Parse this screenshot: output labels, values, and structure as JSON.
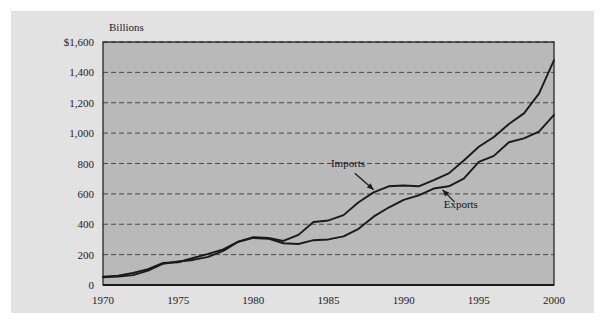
{
  "figure": {
    "unit_label": "Billions",
    "background_color": "#e2e2e2",
    "plot_fill_color": "#b9b9b9",
    "gridline_color": "#4a4a4a",
    "axis_color": "#1a1a1a",
    "line_color": "#1a1a1a"
  },
  "chart_data": {
    "type": "line",
    "title": "",
    "subtitle": "",
    "xlabel": "",
    "ylabel": "Billions",
    "xlim": [
      1970,
      2000
    ],
    "ylim": [
      0,
      1600
    ],
    "grid": true,
    "legend_position": "inline-annotations",
    "x_ticks": [
      1970,
      1975,
      1980,
      1985,
      1990,
      1995,
      2000
    ],
    "x_tick_labels": [
      "1970",
      "1975",
      "1980",
      "1985",
      "1990",
      "1995",
      "2000"
    ],
    "y_ticks": [
      0,
      200,
      400,
      600,
      800,
      1000,
      1200,
      1400,
      1600
    ],
    "y_tick_labels": [
      "0",
      "200",
      "400",
      "600",
      "800",
      "1,000",
      "1,200",
      "1,400",
      "$1,600"
    ],
    "x": [
      1970,
      1971,
      1972,
      1973,
      1974,
      1975,
      1976,
      1977,
      1978,
      1979,
      1980,
      1981,
      1982,
      1983,
      1984,
      1985,
      1986,
      1987,
      1988,
      1989,
      1990,
      1991,
      1992,
      1993,
      1994,
      1995,
      1996,
      1997,
      1998,
      1999,
      2000
    ],
    "series": [
      {
        "name": "Imports",
        "values": [
          55,
          62,
          79,
          105,
          145,
          150,
          178,
          205,
          235,
          285,
          315,
          310,
          290,
          330,
          415,
          425,
          460,
          545,
          610,
          650,
          655,
          650,
          690,
          735,
          820,
          910,
          975,
          1060,
          1130,
          1260,
          1480
        ],
        "annotation": {
          "label": "Imports",
          "label_x": 1986.3,
          "label_y": 775,
          "arrow_to_x": 1988.2,
          "arrow_to_y": 610
        }
      },
      {
        "name": "Exports",
        "values": [
          50,
          55,
          65,
          95,
          140,
          155,
          165,
          185,
          225,
          285,
          310,
          305,
          275,
          270,
          295,
          300,
          320,
          370,
          450,
          510,
          560,
          590,
          635,
          650,
          700,
          810,
          850,
          940,
          965,
          1010,
          1120
        ],
        "annotation": {
          "label": "Exports",
          "label_x": 1993.8,
          "label_y": 505,
          "arrow_to_x": 1992.4,
          "arrow_to_y": 645
        }
      }
    ]
  }
}
